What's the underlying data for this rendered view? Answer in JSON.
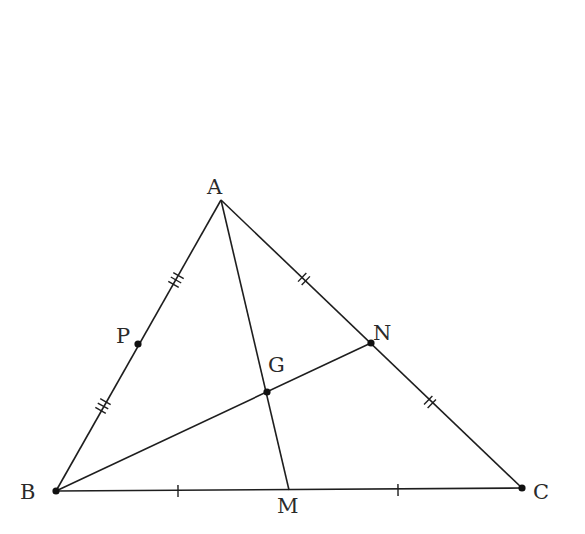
{
  "diagram": {
    "type": "triangle-medians",
    "points": {
      "A": {
        "label": "A",
        "x": 221,
        "y": 200,
        "lx": 207,
        "ly": 194,
        "dot": false
      },
      "B": {
        "label": "B",
        "x": 56,
        "y": 491,
        "lx": 20,
        "ly": 499,
        "dot": true
      },
      "C": {
        "label": "C",
        "x": 522,
        "y": 488,
        "lx": 533,
        "ly": 499,
        "dot": true
      },
      "M": {
        "label": "M",
        "x": 289,
        "y": 490,
        "lx": 277,
        "ly": 513,
        "dot": false
      },
      "N": {
        "label": "N",
        "x": 371,
        "y": 343,
        "lx": 373,
        "ly": 340,
        "dot": true
      },
      "G": {
        "label": "G",
        "x": 267,
        "y": 392,
        "lx": 268,
        "ly": 372,
        "dot": true
      },
      "P": {
        "label": "P",
        "x": 138,
        "y": 344,
        "lx": 116,
        "ly": 343,
        "dot": true
      }
    },
    "segments": [
      {
        "name": "side-AB",
        "from": "A",
        "to": "B"
      },
      {
        "name": "side-AC",
        "from": "A",
        "to": "C"
      },
      {
        "name": "side-BC",
        "from": "B",
        "to": "C"
      },
      {
        "name": "median-AM",
        "from": "A",
        "to": "M"
      },
      {
        "name": "median-BN",
        "from": "B",
        "to": "N"
      }
    ],
    "tick_marks": [
      {
        "segment": "AP",
        "count": 3,
        "at": [
          176,
          280
        ]
      },
      {
        "segment": "PB",
        "count": 3,
        "at": [
          103,
          406
        ]
      },
      {
        "segment": "AN",
        "count": 2,
        "at": [
          304,
          279
        ]
      },
      {
        "segment": "NC",
        "count": 2,
        "at": [
          430,
          402
        ]
      },
      {
        "segment": "BM",
        "count": 1,
        "at": [
          178,
          491
        ]
      },
      {
        "segment": "MC",
        "count": 1,
        "at": [
          398,
          490
        ]
      }
    ]
  }
}
